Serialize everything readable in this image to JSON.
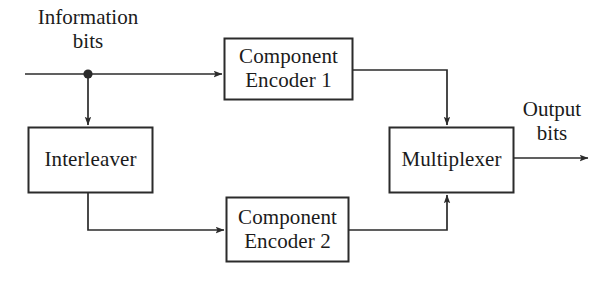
{
  "diagram": {
    "stroke_color": "#2b2b2b",
    "text_color": "#1b1b1b",
    "background_color": "#ffffff",
    "blocks": [
      {
        "id": "component-encoder-1",
        "line1": "Component",
        "line2": "Encoder 1"
      },
      {
        "id": "interleaver",
        "line1": "Interleaver",
        "line2": ""
      },
      {
        "id": "component-encoder-2",
        "line1": "Component",
        "line2": "Encoder 2"
      },
      {
        "id": "multiplexer",
        "line1": "Multiplexer",
        "line2": ""
      }
    ],
    "labels": {
      "input": {
        "line1": "Information",
        "line2": "bits"
      },
      "output": {
        "line1": "Output",
        "line2": "bits"
      }
    },
    "connections": [
      {
        "id": "input-to-branch",
        "from": "information-bits",
        "to": "branch-node"
      },
      {
        "id": "branch-to-encoder-1",
        "from": "branch-node",
        "to": "component-encoder-1"
      },
      {
        "id": "branch-to-interleaver",
        "from": "branch-node",
        "to": "interleaver"
      },
      {
        "id": "interleaver-to-encoder-2",
        "from": "interleaver",
        "to": "component-encoder-2"
      },
      {
        "id": "encoder-1-to-multiplexer",
        "from": "component-encoder-1",
        "to": "multiplexer"
      },
      {
        "id": "encoder-2-to-multiplexer",
        "from": "component-encoder-2",
        "to": "multiplexer"
      },
      {
        "id": "multiplexer-to-output",
        "from": "multiplexer",
        "to": "output-bits"
      }
    ]
  }
}
